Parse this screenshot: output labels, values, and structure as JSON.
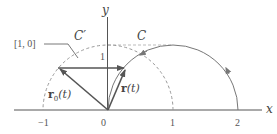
{
  "diagram": {
    "axes": {
      "x_label": "x",
      "y_label": "y",
      "x_ticks": [
        "−1",
        "0",
        "1",
        "2"
      ],
      "y_ticks": [
        "1"
      ]
    },
    "curves": {
      "C": {
        "label": "C",
        "style": "solid",
        "description": "semicircle centered at (1,0) radius 1, counter-clockwise arrows"
      },
      "C_prime": {
        "label": "C′",
        "style": "dashed",
        "description": "upper unit semicircle centered at origin"
      }
    },
    "vectors": {
      "r": {
        "label_main": "r",
        "label_arg": "(t)"
      },
      "r0": {
        "label_main": "r",
        "label_sub": "0",
        "label_arg": "(t)"
      },
      "translation": {
        "description": "horizontal arrow from r0(t) tip to r(t) tip"
      }
    },
    "annotation": {
      "label": "[1, 0]"
    },
    "colors": {
      "axis": "#555555",
      "curve": "#777777",
      "vector": "#555555",
      "dashed": "#999999"
    }
  }
}
